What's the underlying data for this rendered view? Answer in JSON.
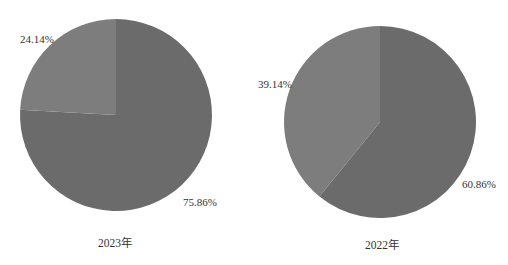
{
  "chart_data": [
    {
      "type": "pie",
      "title": "2023年",
      "categories": [
        "A",
        "B"
      ],
      "values": [
        75.86,
        24.14
      ],
      "labels": [
        "75.86%",
        "24.14%"
      ],
      "colors": [
        "#6b6b6b",
        "#7d7d7d"
      ],
      "start_angle": "12 o'clock",
      "direction": "clockwise",
      "legend": "none"
    },
    {
      "type": "pie",
      "title": "2022年",
      "categories": [
        "A",
        "B"
      ],
      "values": [
        60.86,
        39.14
      ],
      "labels": [
        "60.86%",
        "39.14%"
      ],
      "colors": [
        "#6b6b6b",
        "#7d7d7d"
      ],
      "start_angle": "12 o'clock",
      "direction": "clockwise",
      "legend": "none"
    }
  ]
}
